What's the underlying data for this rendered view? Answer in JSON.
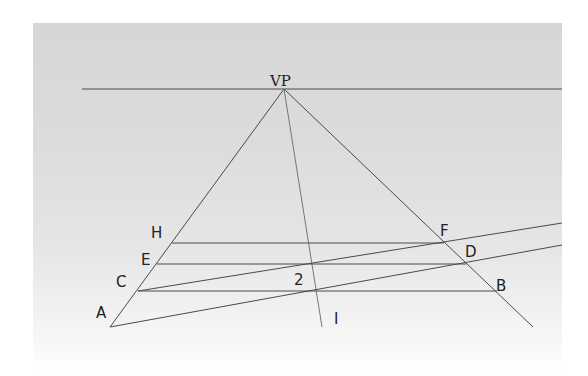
{
  "diagram": {
    "labels": {
      "vp": "VP",
      "a": "A",
      "b": "B",
      "c": "C",
      "d": "D",
      "e": "E",
      "f": "F",
      "h": "H",
      "i": "I",
      "two": "2"
    },
    "colors": {
      "line": "#4a4a4a",
      "background": "#dcdcdc",
      "text": "#222222"
    }
  }
}
